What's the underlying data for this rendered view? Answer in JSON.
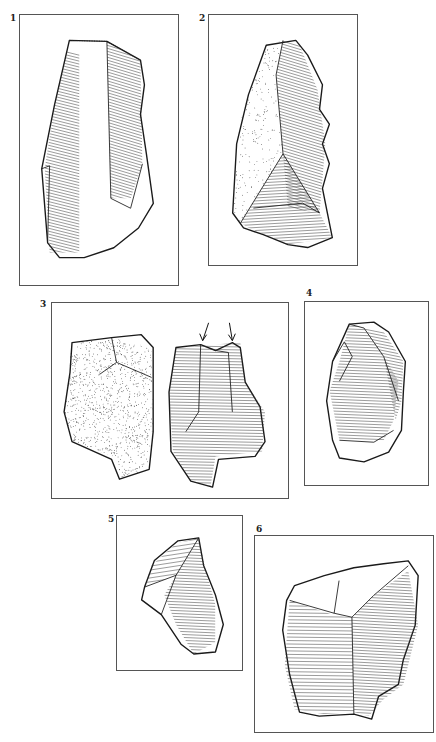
{
  "figure": {
    "type": "lithic-illustration-plate",
    "artifacts": [
      {
        "id": "1",
        "label": "1",
        "description": "blade with retouched right edge and cortex at top"
      },
      {
        "id": "2",
        "label": "2",
        "description": "pointed flake with stippled cortex on left face and notched right edge"
      },
      {
        "id": "3",
        "label": "3",
        "description": "burin shown in two views; cortical face and flaked face with arrows marking burin blows"
      },
      {
        "id": "4",
        "label": "4",
        "description": "ovoid flake with retouched left edge"
      },
      {
        "id": "5",
        "label": "5",
        "description": "small triangular flake"
      },
      {
        "id": "6",
        "label": "6",
        "description": "broad flake with central ridge and retouched edges"
      }
    ],
    "annotations": {
      "arrows": {
        "artifact": "3",
        "count": 2,
        "meaning": "burin-blow-arrow",
        "glyph": "↓"
      }
    },
    "colors": {
      "ink": "#1a1a1a",
      "frame": "#555555",
      "paper": "#ffffff"
    }
  }
}
